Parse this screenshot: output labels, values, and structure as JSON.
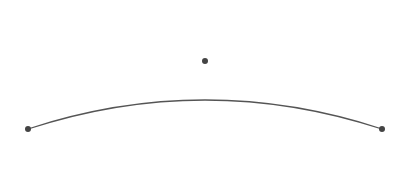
{
  "diagram": {
    "type": "bezier-curve",
    "curve": {
      "start": {
        "x": 28,
        "y": 129
      },
      "control": {
        "x": 205,
        "y": 71
      },
      "end": {
        "x": 382,
        "y": 129
      },
      "stroke": "#555555",
      "stroke_width": 1.3
    },
    "points": [
      {
        "name": "start-point",
        "x": 28,
        "y": 129
      },
      {
        "name": "control-point",
        "x": 205,
        "y": 61
      },
      {
        "name": "end-point",
        "x": 382,
        "y": 129
      }
    ],
    "point_color": "#444444",
    "point_radius": 3
  }
}
